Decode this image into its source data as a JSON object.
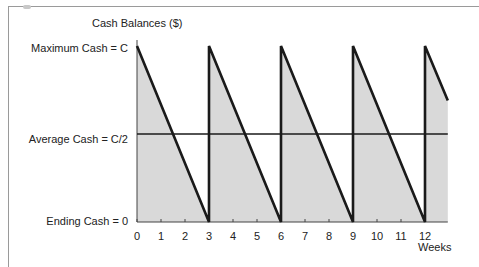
{
  "chart_data": {
    "type": "line",
    "title": "Cash Balances ($)",
    "xlabel": "Weeks",
    "ylabel": "",
    "x_ticks": [
      "0",
      "1",
      "2",
      "3",
      "4",
      "5",
      "6",
      "7",
      "8",
      "9",
      "10",
      "11",
      "12"
    ],
    "y_labels": {
      "max": "Maximum Cash = C",
      "average": "Average Cash = C/2",
      "end": "Ending Cash = 0"
    },
    "xlim": [
      0,
      12.95
    ],
    "ylim": [
      0,
      1
    ],
    "grid": false,
    "legend": null,
    "series": [
      {
        "name": "Cash balance (sawtooth, C → 0 every 3 weeks)",
        "x": [
          0,
          3,
          3,
          6,
          6,
          9,
          9,
          12,
          12,
          12.95
        ],
        "y": [
          1,
          0,
          1,
          0,
          1,
          0,
          1,
          0,
          1,
          0.69
        ],
        "fill": "area below line shaded gray"
      },
      {
        "name": "Average Cash = C/2",
        "x": [
          0,
          12.95
        ],
        "y": [
          0.5,
          0.5
        ]
      }
    ],
    "colors": {
      "line": "#1a1a1a",
      "fill": "#d9d9d9",
      "axis": "#444444",
      "frame": "#9a9a9a"
    }
  },
  "labels": {
    "title": "Cash Balances ($)",
    "max_cash": "Maximum Cash = C",
    "avg_cash": "Average Cash = C/2",
    "end_cash": "Ending Cash = 0",
    "x_axis": "Weeks",
    "ticks": [
      "0",
      "1",
      "2",
      "3",
      "4",
      "5",
      "6",
      "7",
      "8",
      "9",
      "10",
      "11",
      "12"
    ]
  }
}
